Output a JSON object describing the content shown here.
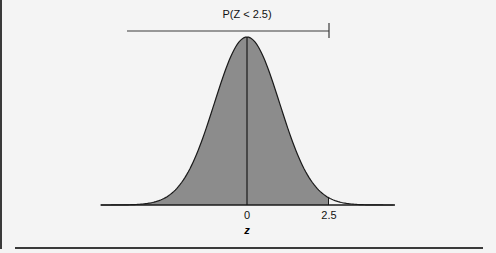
{
  "chart_data": {
    "type": "area",
    "title": "P(Z < 2.5)",
    "xlabel": "z",
    "ylabel": "",
    "distribution": "standard normal",
    "mean": 0,
    "sd": 1,
    "shaded_region": {
      "from": "-inf",
      "to": 2.5
    },
    "tick_labels": [
      "0",
      "2.5"
    ],
    "ticks": [
      0,
      2.5
    ],
    "xlim": [
      -4.5,
      4.5
    ],
    "grid": false,
    "legend": "none",
    "annotation": {
      "text": "P(Z < 2.5)",
      "bracket_end": 2.5
    },
    "colors": {
      "fill": "#8c8c8c",
      "line": "#1a1a1a",
      "background": "#f4f4f4"
    }
  },
  "labels": {
    "title": "P(Z < 2.5)",
    "tick0": "0",
    "tick1": "2.5",
    "xlabel": "z"
  }
}
